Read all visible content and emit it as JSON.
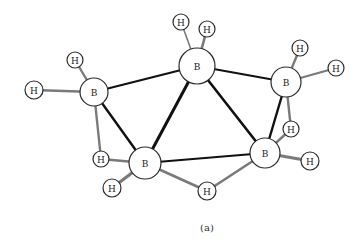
{
  "diagram": {
    "title": "",
    "caption": "(a)",
    "colors": {
      "bb_bond": "#111111",
      "bh_bond": "#7a7a7a",
      "atom_stroke": "#2a2a2a",
      "background": "#ffffff"
    },
    "atoms": [
      {
        "id": "B1",
        "label": "B",
        "x": 94,
        "y": 92,
        "r": 14
      },
      {
        "id": "B2",
        "label": "B",
        "x": 197,
        "y": 66,
        "r": 18
      },
      {
        "id": "B3",
        "label": "B",
        "x": 286,
        "y": 82,
        "r": 15
      },
      {
        "id": "B4",
        "label": "B",
        "x": 145,
        "y": 163,
        "r": 16
      },
      {
        "id": "B5",
        "label": "B",
        "x": 265,
        "y": 153,
        "r": 15
      },
      {
        "id": "H1",
        "label": "H",
        "x": 75,
        "y": 60,
        "r": 8
      },
      {
        "id": "H2",
        "label": "H",
        "x": 34,
        "y": 90,
        "r": 9
      },
      {
        "id": "H3",
        "label": "H",
        "x": 181,
        "y": 22,
        "r": 8
      },
      {
        "id": "H4",
        "label": "H",
        "x": 207,
        "y": 29,
        "r": 8
      },
      {
        "id": "H5",
        "label": "H",
        "x": 300,
        "y": 48,
        "r": 8
      },
      {
        "id": "H6",
        "label": "H",
        "x": 336,
        "y": 68,
        "r": 8
      },
      {
        "id": "H7",
        "label": "H",
        "x": 101,
        "y": 159,
        "r": 8
      },
      {
        "id": "H8",
        "label": "H",
        "x": 112,
        "y": 188,
        "r": 9
      },
      {
        "id": "H9",
        "label": "H",
        "x": 207,
        "y": 191,
        "r": 9
      },
      {
        "id": "H10",
        "label": "H",
        "x": 291,
        "y": 129,
        "r": 8
      },
      {
        "id": "H11",
        "label": "H",
        "x": 310,
        "y": 161,
        "r": 9
      }
    ],
    "bonds": [
      {
        "from": "B1",
        "to": "B2",
        "type": "bb",
        "width": 2
      },
      {
        "from": "B1",
        "to": "B4",
        "type": "bb",
        "width": 2.4
      },
      {
        "from": "B2",
        "to": "B3",
        "type": "bb",
        "width": 2
      },
      {
        "from": "B2",
        "to": "B4",
        "type": "bb",
        "width": 3
      },
      {
        "from": "B2",
        "to": "B5",
        "type": "bb",
        "width": 2.6
      },
      {
        "from": "B3",
        "to": "B5",
        "type": "bb",
        "width": 2.4
      },
      {
        "from": "B4",
        "to": "B5",
        "type": "bb",
        "width": 2
      },
      {
        "from": "B1",
        "to": "H1",
        "type": "bh",
        "width": 2.4
      },
      {
        "from": "B1",
        "to": "H2",
        "type": "bh",
        "width": 2.4
      },
      {
        "from": "B2",
        "to": "H3",
        "type": "bh",
        "width": 1.6
      },
      {
        "from": "B2",
        "to": "H4",
        "type": "bh",
        "width": 2.6
      },
      {
        "from": "B3",
        "to": "H5",
        "type": "bh",
        "width": 2.4
      },
      {
        "from": "B3",
        "to": "H6",
        "type": "bh",
        "width": 2.2
      },
      {
        "from": "B1",
        "to": "H7",
        "type": "bh",
        "width": 2.4
      },
      {
        "from": "B4",
        "to": "H7",
        "type": "bh",
        "width": 2.6
      },
      {
        "from": "B4",
        "to": "H8",
        "type": "bh",
        "width": 3.2
      },
      {
        "from": "B4",
        "to": "H9",
        "type": "bh",
        "width": 2.6
      },
      {
        "from": "B5",
        "to": "H9",
        "type": "bh",
        "width": 2.6
      },
      {
        "from": "B3",
        "to": "H10",
        "type": "bh",
        "width": 2.4
      },
      {
        "from": "B5",
        "to": "H10",
        "type": "bh",
        "width": 2.4
      },
      {
        "from": "B5",
        "to": "H11",
        "type": "bh",
        "width": 3.2
      }
    ]
  }
}
